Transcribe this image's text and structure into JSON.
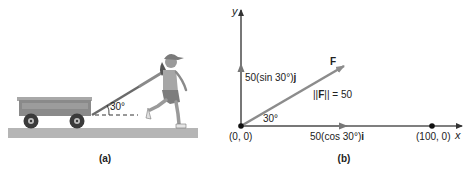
{
  "panel_a": {
    "caption": "(a)",
    "angle_label": "30°",
    "colors": {
      "wagon": "#8a8a8a",
      "ground": "#b5b5b5",
      "handle": "#6a6a6a",
      "wheel": "#3a3a3a"
    }
  },
  "panel_b": {
    "caption": "(b)",
    "y_axis_label": "y",
    "x_axis_label": "x",
    "origin_label": "(0, 0)",
    "point_label": "(100, 0)",
    "vector_label": "F",
    "magnitude_label_prefix": "||",
    "magnitude_label_bold": "F",
    "magnitude_label_suffix": "|| = 50",
    "vertical_component": {
      "prefix": "50(sin 30°)",
      "unit": "j"
    },
    "horizontal_component": {
      "prefix": "50(cos 30°)",
      "unit": "i"
    },
    "angle_label": "30°",
    "colors": {
      "vector": "#8c8c8c",
      "axis": "#333333",
      "point": "#111111"
    }
  }
}
